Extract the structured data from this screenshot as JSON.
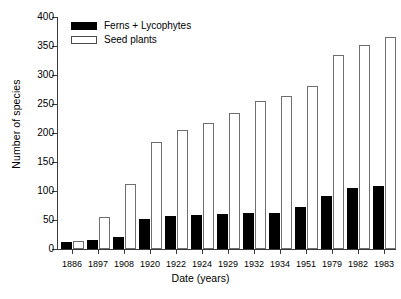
{
  "chart_data": {
    "type": "bar",
    "title": "",
    "xlabel": "Date (years)",
    "ylabel": "Number of species",
    "categories": [
      "1886",
      "1897",
      "1908",
      "1920",
      "1922",
      "1924",
      "1929",
      "1932",
      "1934",
      "1951",
      "1979",
      "1982",
      "1983"
    ],
    "series": [
      {
        "name": "Ferns  + Lycophytes",
        "color": "#000000",
        "style": "filled",
        "values": [
          12,
          15,
          20,
          52,
          57,
          58,
          60,
          62,
          62,
          73,
          92,
          105,
          108
        ]
      },
      {
        "name": "Seed plants",
        "color": "#ffffff",
        "style": "outlined",
        "values": [
          14,
          55,
          112,
          185,
          205,
          218,
          235,
          256,
          263,
          281,
          335,
          352,
          365
        ]
      }
    ],
    "ylim": [
      0,
      400
    ],
    "yticks": [
      0,
      50,
      100,
      150,
      200,
      250,
      300,
      350,
      400
    ],
    "ytick_labels": [
      "0",
      "50",
      "100",
      "150",
      "200",
      "250",
      "300",
      "350",
      "400"
    ],
    "grid": false,
    "legend_position": "top-left"
  },
  "legend": {
    "items": [
      {
        "label": "Ferns  + Lycophytes",
        "swatch": "filled-black-rect"
      },
      {
        "label": "Seed plants",
        "swatch": "outlined-white-rect"
      }
    ]
  },
  "axes": {
    "x_title": "Date (years)",
    "y_title": "Number of species"
  }
}
